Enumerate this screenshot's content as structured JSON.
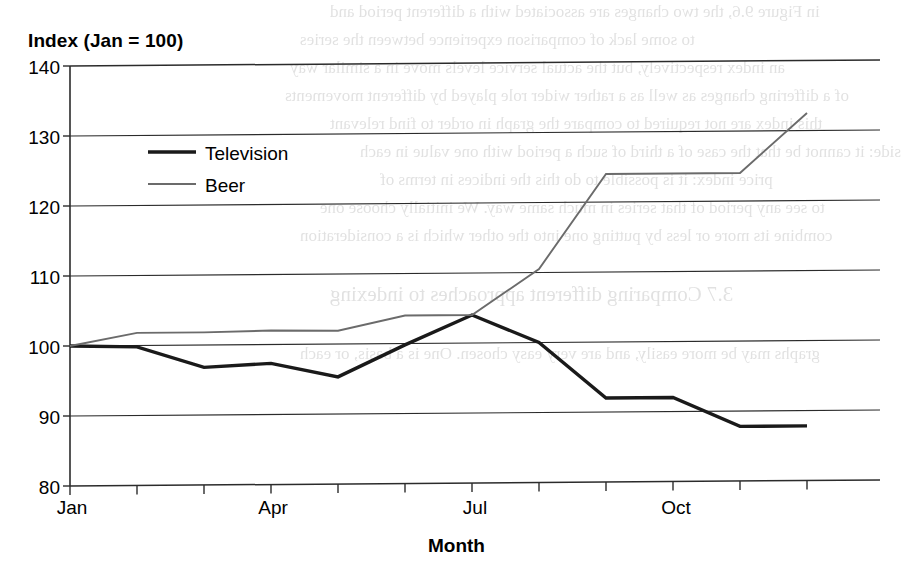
{
  "chart_data": {
    "type": "line",
    "title": "",
    "ylabel": "Index (Jan = 100)",
    "xlabel": "Month",
    "ylim": [
      80,
      140
    ],
    "y_ticks": [
      140,
      130,
      120,
      110,
      100,
      90,
      80
    ],
    "grid": true,
    "legend_position": "upper-left-inside",
    "categories": [
      "Jan",
      "Feb",
      "Mar",
      "Apr",
      "May",
      "Jun",
      "Jul",
      "Aug",
      "Sep",
      "Oct",
      "Nov",
      "Dec"
    ],
    "x_tick_labels": [
      "Jan",
      "Apr",
      "Jul",
      "Oct"
    ],
    "x_tick_label_positions": [
      0,
      3,
      6,
      9
    ],
    "series": [
      {
        "name": "Television",
        "color": "#1a1a1a",
        "width": 3.4,
        "values": [
          100,
          99.8,
          96.8,
          97.3,
          95.3,
          99.8,
          104,
          100,
          92,
          92,
          87.8,
          87.8
        ]
      },
      {
        "name": "Beer",
        "color": "#6b6b6b",
        "width": 1.9,
        "values": [
          100,
          101.8,
          101.8,
          102,
          101.9,
          104,
          104,
          110.5,
          124,
          124,
          124,
          132.5
        ]
      }
    ]
  },
  "legend": {
    "items": [
      {
        "label": "Television",
        "swatch": "television-line-swatch"
      },
      {
        "label": "Beer",
        "swatch": "beer-line-swatch"
      }
    ]
  },
  "bleed_text": {
    "lines": [
      "in Figure 9.6, the two changes are associated with a different period and",
      "to some lack of comparison experience between the series",
      "an index respectively, but the actual service levels move in a similar way",
      "of a differing changes as well as a rather wider role played by different movements",
      "this index are not required to compare the graph in order to find relevant",
      "side: it cannot be that the case of a third of such a period with one value in each",
      "price index: it is possible to do this the indices in terms of",
      "to see any period of that series in much same way. We initially choose one",
      "combine its more or less by putting one into the other which is a consideration",
      "3.7 Comparing different approaches to indexing",
      "graphs may be more easily, and are very easy chosen. One is a basis, or each"
    ]
  }
}
